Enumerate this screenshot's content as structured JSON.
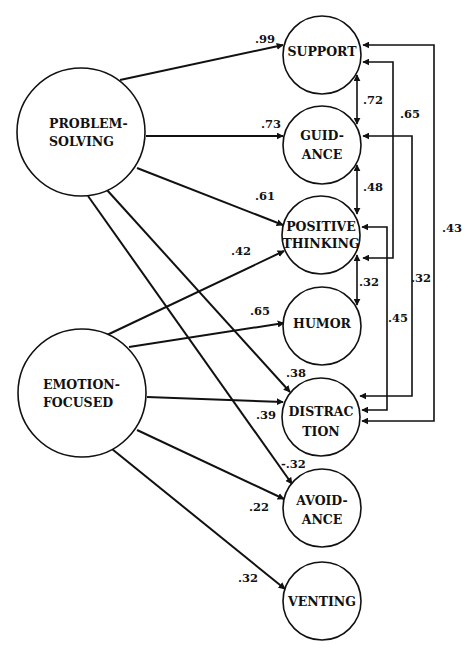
{
  "diagram": {
    "type": "path-diagram",
    "latent_factors": [
      {
        "id": "problem_solving",
        "label_lines": [
          "PROBLEM-",
          "SOLVING"
        ]
      },
      {
        "id": "emotion_focused",
        "label_lines": [
          "EMOTION-",
          "FOCUSED"
        ]
      }
    ],
    "indicators": [
      {
        "id": "support",
        "label_lines": [
          "SUPPORT"
        ]
      },
      {
        "id": "guidance",
        "label_lines": [
          "GUID-",
          "ANCE"
        ]
      },
      {
        "id": "positive_thinking",
        "label_lines": [
          "POSITIVE",
          "THINKING"
        ]
      },
      {
        "id": "humor",
        "label_lines": [
          "HUMOR"
        ]
      },
      {
        "id": "distraction",
        "label_lines": [
          "DISTRAC",
          "TION"
        ]
      },
      {
        "id": "avoidance",
        "label_lines": [
          "AVOID-",
          "ANCE"
        ]
      },
      {
        "id": "venting",
        "label_lines": [
          "VENTING"
        ]
      }
    ],
    "loadings": [
      {
        "from": "problem_solving",
        "to": "support",
        "value": ".99"
      },
      {
        "from": "problem_solving",
        "to": "guidance",
        "value": ".73"
      },
      {
        "from": "problem_solving",
        "to": "positive_thinking",
        "value": ".61"
      },
      {
        "from": "problem_solving",
        "to": "distraction",
        "value": ".38"
      },
      {
        "from": "problem_solving",
        "to": "avoidance",
        "value": "-.32"
      },
      {
        "from": "emotion_focused",
        "to": "positive_thinking",
        "value": ".42"
      },
      {
        "from": "emotion_focused",
        "to": "humor",
        "value": ".65"
      },
      {
        "from": "emotion_focused",
        "to": "distraction",
        "value": ".39"
      },
      {
        "from": "emotion_focused",
        "to": "avoidance",
        "value": ".22"
      },
      {
        "from": "emotion_focused",
        "to": "venting",
        "value": ".32"
      }
    ],
    "correlations": [
      {
        "between": [
          "support",
          "guidance"
        ],
        "value": ".72"
      },
      {
        "between": [
          "guidance",
          "positive_thinking"
        ],
        "value": ".48"
      },
      {
        "between": [
          "positive_thinking",
          "humor"
        ],
        "value": ".32"
      },
      {
        "between": [
          "support",
          "positive_thinking"
        ],
        "value": ".65"
      },
      {
        "between": [
          "positive_thinking",
          "distraction"
        ],
        "value": ".45"
      },
      {
        "between": [
          "guidance",
          "distraction"
        ],
        "value": ".32"
      },
      {
        "between": [
          "support",
          "distraction"
        ],
        "value": ".43"
      }
    ]
  }
}
